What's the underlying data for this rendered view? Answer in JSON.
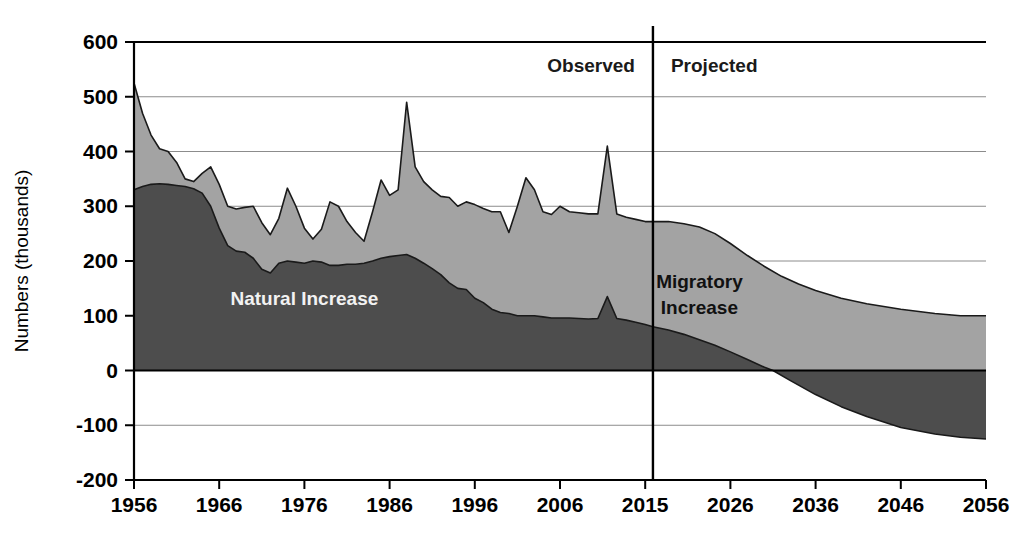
{
  "chart_data": {
    "type": "area",
    "title": "",
    "xlabel": "",
    "ylabel": "Numbers (thousands)",
    "ylim": [
      -200,
      600
    ],
    "xlim": [
      1956,
      2056
    ],
    "grid": true,
    "legend_position": "inline-annotations",
    "ytick_labels": [
      "600",
      "500",
      "400",
      "300",
      "200",
      "100",
      "0",
      "-100",
      "-200"
    ],
    "ytick_values": [
      600,
      500,
      400,
      300,
      200,
      100,
      0,
      -100,
      -200
    ],
    "xtick_labels": [
      "1956",
      "1966",
      "1976",
      "1986",
      "1996",
      "2006",
      "2015",
      "2026",
      "2036",
      "2046",
      "2056"
    ],
    "xtick_values": [
      1956,
      1966,
      1976,
      1986,
      1996,
      2006,
      2015,
      2026,
      2036,
      2046,
      2056
    ],
    "annotations": [
      {
        "text": "Observed",
        "x": 2001,
        "y": 545
      },
      {
        "text": "Projected",
        "x": 2022,
        "y": 545
      },
      {
        "text": "Natural Increase",
        "x": 1976,
        "y": 120
      },
      {
        "text": "Migratory Increase",
        "x": 2022,
        "y": 150
      }
    ],
    "divider": {
      "label": "observed-projected-divider",
      "x": 2016
    },
    "colors": {
      "natural_increase": "#4d4d4d",
      "migratory_increase": "#a3a3a3",
      "axis": "#000000",
      "grid": "#808080",
      "background": "#ffffff"
    },
    "series": [
      {
        "name": "Natural Increase",
        "x": [
          1956,
          1957,
          1958,
          1959,
          1960,
          1961,
          1962,
          1963,
          1964,
          1965,
          1966,
          1967,
          1968,
          1969,
          1970,
          1971,
          1972,
          1973,
          1974,
          1975,
          1976,
          1977,
          1978,
          1979,
          1980,
          1981,
          1982,
          1983,
          1984,
          1985,
          1986,
          1987,
          1988,
          1989,
          1990,
          1991,
          1992,
          1993,
          1994,
          1995,
          1996,
          1997,
          1998,
          1999,
          2000,
          2001,
          2002,
          2003,
          2004,
          2005,
          2006,
          2007,
          2008,
          2009,
          2010,
          2011,
          2012,
          2013,
          2014,
          2015,
          2016,
          2018,
          2020,
          2022,
          2024,
          2026,
          2028,
          2030,
          2031,
          2033,
          2036,
          2039,
          2042,
          2046,
          2050,
          2053,
          2056
        ],
        "values": [
          330,
          336,
          340,
          341,
          340,
          338,
          336,
          332,
          324,
          300,
          260,
          228,
          218,
          216,
          205,
          185,
          178,
          196,
          200,
          198,
          196,
          200,
          198,
          192,
          192,
          194,
          194,
          196,
          200,
          205,
          208,
          210,
          212,
          205,
          196,
          186,
          175,
          160,
          150,
          148,
          132,
          124,
          112,
          106,
          104,
          100,
          100,
          100,
          98,
          96,
          96,
          96,
          95,
          94,
          95,
          135,
          95,
          92,
          88,
          84,
          80,
          74,
          66,
          56,
          46,
          34,
          20,
          6,
          0,
          -18,
          -44,
          -66,
          -84,
          -104,
          -116,
          -122,
          -125
        ]
      },
      {
        "name": "Total (Natural + Migratory Increase)",
        "x": [
          1956,
          1957,
          1958,
          1959,
          1960,
          1961,
          1962,
          1963,
          1964,
          1965,
          1966,
          1967,
          1968,
          1969,
          1970,
          1971,
          1972,
          1973,
          1974,
          1975,
          1976,
          1977,
          1978,
          1979,
          1980,
          1981,
          1982,
          1983,
          1984,
          1985,
          1986,
          1987,
          1988,
          1989,
          1990,
          1991,
          1992,
          1993,
          1994,
          1995,
          1996,
          1997,
          1998,
          1999,
          2000,
          2001,
          2002,
          2003,
          2004,
          2005,
          2006,
          2007,
          2008,
          2009,
          2010,
          2011,
          2012,
          2013,
          2014,
          2015,
          2016,
          2018,
          2020,
          2022,
          2024,
          2026,
          2028,
          2030,
          2032,
          2034,
          2036,
          2039,
          2042,
          2046,
          2050,
          2053,
          2056
        ],
        "values": [
          525,
          470,
          430,
          405,
          400,
          380,
          350,
          345,
          360,
          372,
          340,
          300,
          295,
          298,
          300,
          270,
          248,
          278,
          333,
          300,
          260,
          240,
          258,
          308,
          300,
          272,
          252,
          236,
          290,
          348,
          320,
          330,
          490,
          372,
          345,
          330,
          318,
          316,
          300,
          308,
          303,
          296,
          290,
          290,
          252,
          300,
          352,
          330,
          290,
          285,
          300,
          290,
          288,
          286,
          286,
          410,
          286,
          280,
          276,
          272,
          272,
          272,
          268,
          262,
          250,
          232,
          210,
          190,
          172,
          158,
          146,
          132,
          122,
          112,
          104,
          100,
          100
        ]
      }
    ]
  },
  "ylabel_text": "Numbers (thousands)"
}
